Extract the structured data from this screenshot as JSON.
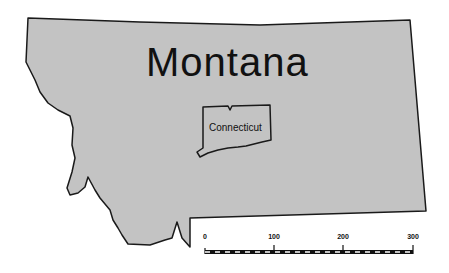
{
  "map": {
    "title": "Montana",
    "fill_color": "#c3c3c3",
    "outline_color": "#1a1a1a",
    "inset": {
      "label": "Connecticut",
      "fill_color": "#c3c3c3"
    },
    "scale_bar": {
      "ticks": [
        "0",
        "100",
        "200",
        "300"
      ],
      "units": ""
    }
  }
}
